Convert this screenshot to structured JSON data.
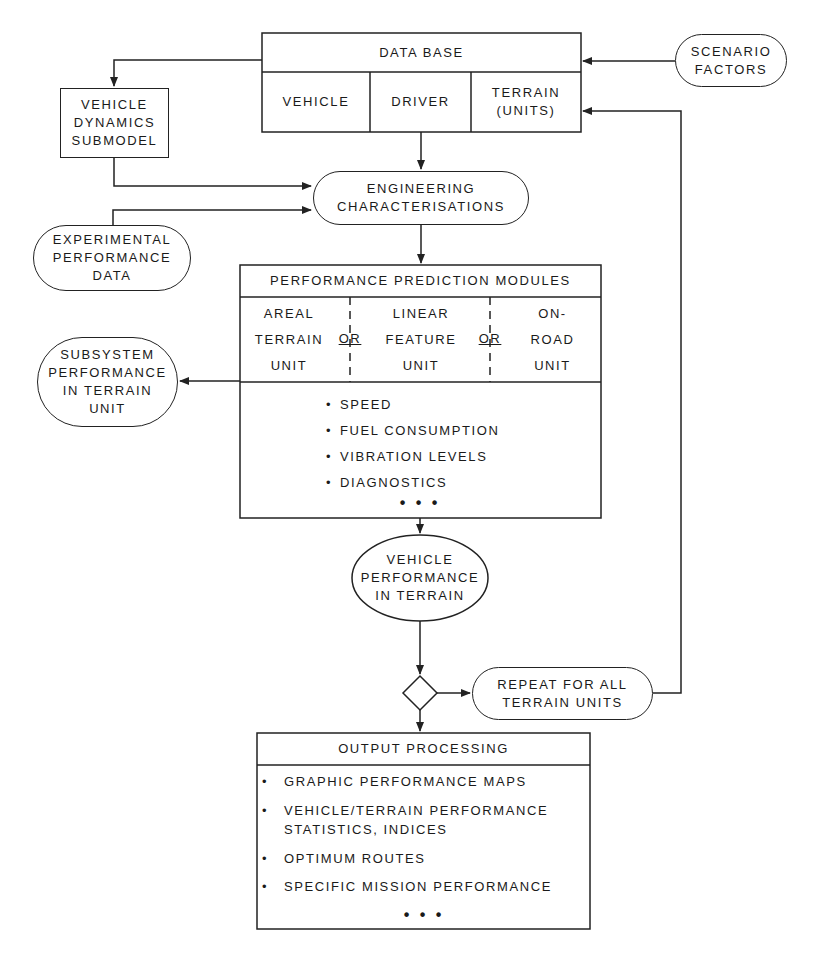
{
  "diagram": {
    "colors": {
      "line": "#222222",
      "background": "#ffffff"
    },
    "data_base": {
      "title": "DATA BASE",
      "columns": [
        "VEHICLE",
        "DRIVER",
        "TERRAIN\n(UNITS)"
      ]
    },
    "scenario_factors": "SCENARIO\nFACTORS",
    "vehicle_dynamics_submodel": "VEHICLE\nDYNAMICS\nSUBMODEL",
    "engineering_characterisations": "ENGINEERING\nCHARACTERISATIONS",
    "experimental_performance_data": "EXPERIMENTAL\nPERFORMANCE\nDATA",
    "performance_prediction_modules": {
      "title": "PERFORMANCE PREDICTION MODULES",
      "modules": [
        "AREAL\nTERRAIN\nUNIT",
        "LINEAR\nFEATURE\nUNIT",
        "ON-\nROAD\nUNIT"
      ],
      "separator": "OR",
      "outputs": [
        "SPEED",
        "FUEL CONSUMPTION",
        "VIBRATION LEVELS",
        "DIAGNOSTICS"
      ],
      "ellipsis": "• • •"
    },
    "subsystem_performance": "SUBSYSTEM\nPERFORMANCE\nIN TERRAIN\nUNIT",
    "vehicle_performance_in_terrain": "VEHICLE\nPERFORMANCE\nIN TERRAIN",
    "repeat_for_all": "REPEAT FOR ALL\nTERRAIN UNITS",
    "output_processing": {
      "title": "OUTPUT PROCESSING",
      "items": [
        "GRAPHIC PERFORMANCE MAPS",
        "VEHICLE/TERRAIN PERFORMANCE\nSTATISTICS, INDICES",
        "OPTIMUM ROUTES",
        "SPECIFIC MISSION PERFORMANCE"
      ],
      "ellipsis": "• • •"
    },
    "bullet": "•"
  }
}
